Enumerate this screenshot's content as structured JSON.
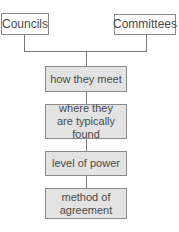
{
  "diagram": {
    "type": "comparison-flowchart",
    "top_nodes": [
      {
        "id": "councils",
        "label": "Councils"
      },
      {
        "id": "committees",
        "label": "Committees"
      }
    ],
    "criteria": [
      {
        "id": "how-they-meet",
        "label": "how they meet"
      },
      {
        "id": "where-found",
        "label": "where they are typically found"
      },
      {
        "id": "level-of-power",
        "label": "level of power"
      },
      {
        "id": "method-of-agreement",
        "label": "method of agreement"
      }
    ],
    "colors": {
      "line": "#7a7a7a",
      "box_border": "#8a8a8a",
      "criteria_fill": "#e3e3e3",
      "top_fill": "#ffffff",
      "text": "#4a4a4a"
    }
  }
}
